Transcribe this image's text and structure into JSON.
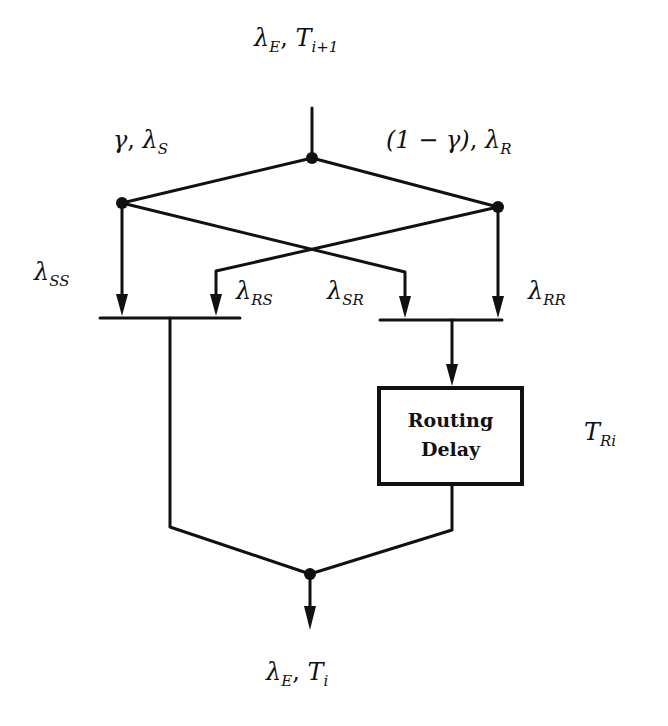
{
  "diagram": {
    "type": "flow-diagram",
    "input": {
      "rate": "λ",
      "rate_sub": "E",
      "time": "T",
      "time_sub": "i+1"
    },
    "split_left": {
      "prob": "γ",
      "rate": "λ",
      "rate_sub": "S"
    },
    "split_right": {
      "prob": "(1 − γ)",
      "rate": "λ",
      "rate_sub": "R"
    },
    "flows": {
      "ss": {
        "sym": "λ",
        "sub": "SS"
      },
      "rs": {
        "sym": "λ",
        "sub": "RS"
      },
      "sr": {
        "sym": "λ",
        "sub": "SR"
      },
      "rr": {
        "sym": "λ",
        "sub": "RR"
      }
    },
    "routing_box": {
      "line1": "Routing",
      "line2": "Delay"
    },
    "routing_time": {
      "sym": "T",
      "sub": "Ri"
    },
    "output": {
      "rate": "λ",
      "rate_sub": "E",
      "time": "T",
      "time_sub": "i"
    },
    "separator": ", ",
    "colors": {
      "ink": "#111111",
      "background": "#ffffff"
    }
  }
}
